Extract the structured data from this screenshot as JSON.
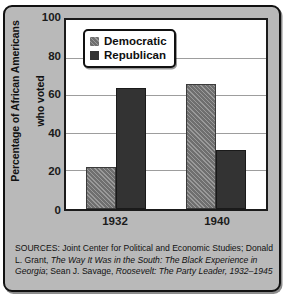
{
  "chart_data": {
    "type": "bar",
    "title": "",
    "subtitle": "",
    "xlabel": "",
    "ylabel": "Percentage of African Americans who voted",
    "categories": [
      "1932",
      "1940"
    ],
    "series": [
      {
        "name": "Democratic",
        "values": [
          22,
          66
        ],
        "color": "#6f6f6f",
        "fill": "diagonal-hatch"
      },
      {
        "name": "Republican",
        "values": [
          64,
          31
        ],
        "color": "#333333",
        "fill": "solid"
      }
    ],
    "ylim": [
      0,
      100
    ],
    "ytick_values": [
      100,
      80,
      60,
      40,
      20,
      0
    ],
    "ytick_labels": [
      "100",
      "80",
      "60",
      "40",
      "20",
      "0"
    ],
    "grid": "horizontal",
    "legend_position": "top-left-inside",
    "annotations": []
  },
  "legend": {
    "items": [
      {
        "label": "Democratic",
        "swatch": "democratic-swatch"
      },
      {
        "label": "Republican",
        "swatch": "republican-swatch"
      }
    ]
  },
  "axes": {
    "y_title_line1": "Percentage of African Americans",
    "y_title_line2": "who voted",
    "y_title_full": "Percentage of African Americans who voted",
    "y_ticks": [
      "100",
      "80",
      "60",
      "40",
      "20",
      "0"
    ],
    "x_ticks": [
      "1932",
      "1940"
    ]
  },
  "sources": {
    "line1_prefix": "SOURCES: Joint Center for Political and Economic Studies; Donald",
    "line2_plain": "L. Grant, ",
    "line2_italic": "The Way It Was in the South: The Black Experience in",
    "line3_italic_a": "Georgia",
    "line3_plain": "; Sean J. Savage, ",
    "line3_italic_b": "Roosevelt: The Party Leader, 1932–1945"
  },
  "colors": {
    "democratic": "#6f6f6f",
    "republican": "#333333",
    "figure_background": "#b9b9b9",
    "plot_background": "#ffffff",
    "frame": "#111111",
    "gridline": "#9d9d9d"
  }
}
